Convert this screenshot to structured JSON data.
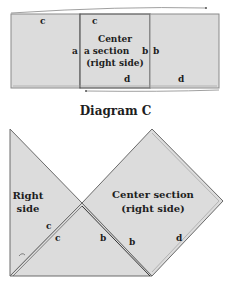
{
  "colors": {
    "fabric": "#dcdcdc",
    "outline": "#6a6a6a",
    "seam": "#4a4a4a",
    "text": "#1e1e1e"
  },
  "top_strip": {
    "left_panel": {
      "labels": {
        "top": "c",
        "right": "a"
      }
    },
    "center_panel": {
      "title_lines": [
        "Center",
        "section",
        "(right side)"
      ],
      "labels": {
        "top": "c",
        "left": "a",
        "right": "b",
        "bottom": "d"
      }
    },
    "right_panel": {
      "labels": {
        "left": "b",
        "bottom": "d"
      }
    }
  },
  "caption": "Diagram C",
  "bottom_figure": {
    "left_triangle": {
      "title_lines": [
        "Right",
        "side"
      ],
      "edge_label": "c"
    },
    "bottom_triangle": {
      "labels": {
        "left": "c",
        "right": "b"
      }
    },
    "diamond": {
      "title_lines": [
        "Center section",
        "(right side)"
      ],
      "labels": {
        "left": "b",
        "right": "d"
      }
    }
  }
}
